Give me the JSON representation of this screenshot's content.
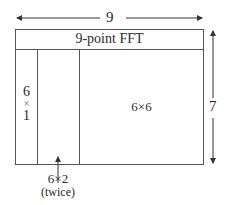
{
  "diagram": {
    "width_label": "9",
    "height_label": "7",
    "header_label": "9-point FFT",
    "left_block": {
      "line1": "6",
      "line2": "×",
      "line3": "1"
    },
    "right_block_label": "6×6",
    "middle_block": {
      "label": "6×2",
      "note": "(twice)"
    },
    "colors": {
      "line": "#555555",
      "text": "#2a2a2a"
    }
  }
}
